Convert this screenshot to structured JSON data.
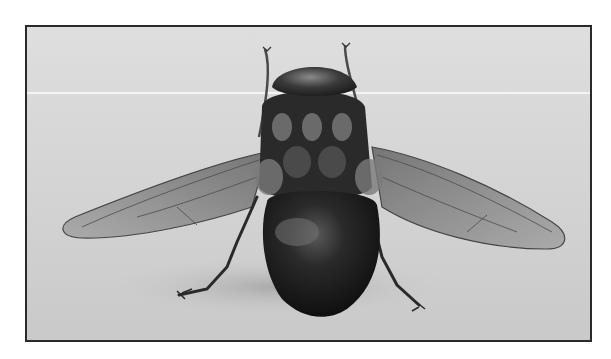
{
  "image": {
    "subject": "Black-and-white photograph of a fly, viewed from above-rear with wings spread",
    "style": "grayscale photograph with thin dark border",
    "colors": {
      "page_background": "#ffffff",
      "photo_background": "#d6d6d6",
      "border": "#2a2a2a",
      "body_dark": "#141414",
      "wing": "#9a9a9a",
      "highlight_line": "#f4f4f4"
    },
    "elements": [
      "antennae",
      "head",
      "thorax",
      "abdomen",
      "left-wing",
      "right-wing",
      "legs",
      "shadow"
    ]
  }
}
